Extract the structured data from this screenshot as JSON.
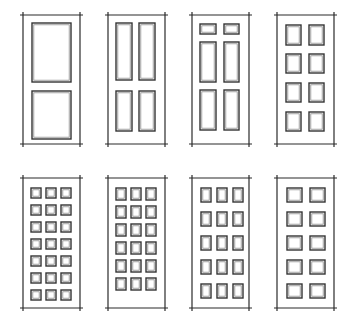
{
  "figure": {
    "title": "",
    "colors": {
      "background": "#ffffff",
      "line": "#2a2a2a"
    },
    "doors": [
      {
        "name": "two-panel-door",
        "x": 23,
        "y": 15,
        "w": 57,
        "h": 129,
        "panels": [
          [
            9,
            8,
            39,
            59
          ],
          [
            9,
            76,
            39,
            48
          ]
        ]
      },
      {
        "name": "four-panel-door",
        "x": 108,
        "y": 15,
        "w": 57,
        "h": 129,
        "panels": [
          [
            8,
            8,
            16,
            57
          ],
          [
            31,
            8,
            16,
            57
          ],
          [
            8,
            76,
            16,
            40
          ],
          [
            31,
            76,
            16,
            40
          ]
        ]
      },
      {
        "name": "six-panel-door",
        "x": 192,
        "y": 15,
        "w": 57,
        "h": 129,
        "panels": [
          [
            8,
            9,
            16,
            10
          ],
          [
            32,
            9,
            15,
            10
          ],
          [
            8,
            27,
            16,
            40
          ],
          [
            32,
            27,
            15,
            40
          ],
          [
            8,
            75,
            16,
            40
          ],
          [
            32,
            75,
            15,
            40
          ]
        ]
      },
      {
        "name": "eight-panel-door",
        "x": 277,
        "y": 15,
        "w": 57,
        "h": 129,
        "panels": [
          [
            9,
            10,
            15,
            20
          ],
          [
            32,
            10,
            15,
            20
          ],
          [
            9,
            39,
            15,
            19
          ],
          [
            32,
            39,
            15,
            19
          ],
          [
            9,
            68,
            15,
            19
          ],
          [
            32,
            68,
            15,
            19
          ],
          [
            9,
            97,
            15,
            19
          ],
          [
            32,
            97,
            15,
            19
          ]
        ]
      },
      {
        "name": "twenty-one-panel-door",
        "x": 23,
        "y": 178,
        "w": 57,
        "h": 130,
        "grid": {
          "cols": 3,
          "rows": 7,
          "startX": 8,
          "startY": 10,
          "cellW": 10,
          "cellH": 10,
          "gapX": 5,
          "gapY": 7
        }
      },
      {
        "name": "eighteen-panel-door",
        "x": 108,
        "y": 178,
        "w": 57,
        "h": 130,
        "grid": {
          "cols": 3,
          "rows": 6,
          "startX": 8,
          "startY": 10,
          "cellW": 10,
          "cellH": 12,
          "gapX": 5,
          "gapY": 6
        }
      },
      {
        "name": "fifteen-panel-door",
        "x": 192,
        "y": 178,
        "w": 57,
        "h": 130,
        "grid": {
          "cols": 3,
          "rows": 5,
          "startX": 9,
          "startY": 10,
          "cellW": 10,
          "cellH": 14,
          "gapX": 6,
          "gapY": 10
        }
      },
      {
        "name": "ten-panel-door",
        "x": 277,
        "y": 178,
        "w": 57,
        "h": 130,
        "grid": {
          "cols": 2,
          "rows": 5,
          "startX": 10,
          "startY": 10,
          "cellW": 15,
          "cellH": 14,
          "gapX": 8,
          "gapY": 10
        }
      }
    ]
  }
}
